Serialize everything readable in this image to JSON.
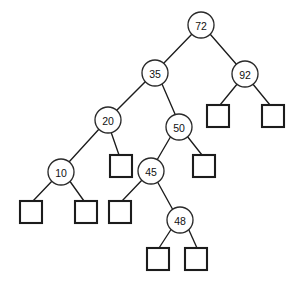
{
  "figure": {
    "type": "binary-search-tree-diagram",
    "width": 301,
    "height": 284,
    "background_color": "#ffffff",
    "stroke_color": "#1c1c1c",
    "node_fill_color": "#ffffff",
    "label_color": "#111111"
  },
  "chart_data": {
    "type": "diagram",
    "title": "",
    "subtitle": "",
    "xlabel": "",
    "ylabel": "",
    "grid": false,
    "legend": "none",
    "shape_legend": {
      "circle": "internal node with key",
      "square": "null / external leaf node"
    },
    "root_key": "72",
    "internal_node_keys": [
      "72",
      "35",
      "92",
      "20",
      "50",
      "10",
      "45",
      "48"
    ],
    "null_leaf_count": 9,
    "levels": [
      {
        "depth": 0,
        "keys": [
          "72"
        ]
      },
      {
        "depth": 1,
        "keys": [
          "35",
          "92"
        ]
      },
      {
        "depth": 2,
        "keys": [
          "20",
          "50"
        ]
      },
      {
        "depth": 3,
        "keys": [
          "10",
          "45"
        ]
      },
      {
        "depth": 4,
        "keys": [
          "48"
        ]
      }
    ],
    "edges": [
      {
        "from": "72",
        "to": "35",
        "side": "left"
      },
      {
        "from": "72",
        "to": "92",
        "side": "right"
      },
      {
        "from": "35",
        "to": "20",
        "side": "left"
      },
      {
        "from": "35",
        "to": "50",
        "side": "right"
      },
      {
        "from": "92",
        "to": "null-92-L",
        "side": "left"
      },
      {
        "from": "92",
        "to": "null-92-R",
        "side": "right"
      },
      {
        "from": "20",
        "to": "10",
        "side": "left"
      },
      {
        "from": "20",
        "to": "null-20-R",
        "side": "right"
      },
      {
        "from": "50",
        "to": "45",
        "side": "left"
      },
      {
        "from": "50",
        "to": "null-50-R",
        "side": "right"
      },
      {
        "from": "10",
        "to": "null-10-L",
        "side": "left"
      },
      {
        "from": "10",
        "to": "null-10-R",
        "side": "right"
      },
      {
        "from": "45",
        "to": "null-45-L",
        "side": "left"
      },
      {
        "from": "45",
        "to": "48",
        "side": "right"
      },
      {
        "from": "48",
        "to": "null-48-L",
        "side": "left"
      },
      {
        "from": "48",
        "to": "null-48-R",
        "side": "right"
      }
    ]
  },
  "nodes": [
    {
      "id": "n72",
      "label": "72",
      "cx": 201,
      "cy": 25,
      "r": 13
    },
    {
      "id": "n35",
      "label": "35",
      "cx": 155,
      "cy": 73,
      "r": 13
    },
    {
      "id": "n92",
      "label": "92",
      "cx": 245,
      "cy": 74,
      "r": 13
    },
    {
      "id": "n20",
      "label": "20",
      "cx": 108,
      "cy": 120,
      "r": 13
    },
    {
      "id": "n50",
      "label": "50",
      "cx": 179,
      "cy": 127,
      "r": 13
    },
    {
      "id": "n10",
      "label": "10",
      "cx": 61,
      "cy": 172,
      "r": 13
    },
    {
      "id": "n45",
      "label": "45",
      "cx": 151,
      "cy": 171,
      "r": 13
    },
    {
      "id": "n48",
      "label": "48",
      "cx": 180,
      "cy": 220,
      "r": 13
    }
  ],
  "leaves": [
    {
      "id": "l92L",
      "x": 207,
      "y": 105,
      "size": 22
    },
    {
      "id": "l92R",
      "x": 262,
      "y": 105,
      "size": 22
    },
    {
      "id": "l20R",
      "x": 110,
      "y": 155,
      "size": 22
    },
    {
      "id": "l50R",
      "x": 193,
      "y": 155,
      "size": 22
    },
    {
      "id": "l10L",
      "x": 20,
      "y": 201,
      "size": 22
    },
    {
      "id": "l10R",
      "x": 75,
      "y": 201,
      "size": 22
    },
    {
      "id": "l45L",
      "x": 109,
      "y": 201,
      "size": 22
    },
    {
      "id": "l48L",
      "x": 147,
      "y": 248,
      "size": 22
    },
    {
      "id": "l48R",
      "x": 185,
      "y": 248,
      "size": 22
    }
  ],
  "edge_segments": [
    {
      "id": "e72-35",
      "x1": 192,
      "y1": 34,
      "x2": 163,
      "y2": 64
    },
    {
      "id": "e72-92",
      "x1": 210,
      "y1": 34,
      "x2": 237,
      "y2": 65
    },
    {
      "id": "e35-20",
      "x1": 146,
      "y1": 81,
      "x2": 116,
      "y2": 111
    },
    {
      "id": "e35-50",
      "x1": 162,
      "y1": 84,
      "x2": 175,
      "y2": 114
    },
    {
      "id": "e92-l92L",
      "x1": 238,
      "y1": 83,
      "x2": 220,
      "y2": 105
    },
    {
      "id": "e92-l92R",
      "x1": 252,
      "y1": 83,
      "x2": 270,
      "y2": 105
    },
    {
      "id": "e20-10",
      "x1": 100,
      "y1": 128,
      "x2": 69,
      "y2": 162
    },
    {
      "id": "e20-l20R",
      "x1": 111,
      "y1": 132,
      "x2": 119,
      "y2": 155
    },
    {
      "id": "e50-45",
      "x1": 171,
      "y1": 136,
      "x2": 157,
      "y2": 160
    },
    {
      "id": "e50-l50R",
      "x1": 187,
      "y1": 136,
      "x2": 202,
      "y2": 155
    },
    {
      "id": "e10-l10L",
      "x1": 53,
      "y1": 180,
      "x2": 33,
      "y2": 201
    },
    {
      "id": "e10-l10R",
      "x1": 69,
      "y1": 180,
      "x2": 84,
      "y2": 201
    },
    {
      "id": "e45-l45L",
      "x1": 143,
      "y1": 179,
      "x2": 122,
      "y2": 201
    },
    {
      "id": "e45-48",
      "x1": 157,
      "y1": 181,
      "x2": 173,
      "y2": 210
    },
    {
      "id": "e48-l48L",
      "x1": 172,
      "y1": 228,
      "x2": 159,
      "y2": 248
    },
    {
      "id": "e48-l48R",
      "x1": 188,
      "y1": 228,
      "x2": 197,
      "y2": 248
    }
  ]
}
